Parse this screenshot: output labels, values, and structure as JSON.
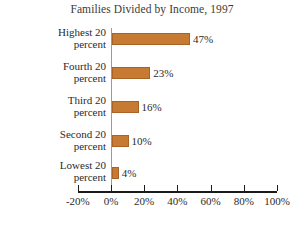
{
  "chart_data": {
    "type": "bar",
    "orientation": "horizontal",
    "title": "Families Divided by Income, 1997",
    "xlabel": "",
    "ylabel": "",
    "categories": [
      "Highest 20 percent",
      "Fourth 20 percent",
      "Third 20 percent",
      "Second 20 percent",
      "Lowest 20 percent"
    ],
    "category_lines": [
      [
        "Highest 20",
        "percent"
      ],
      [
        "Fourth 20",
        "percent"
      ],
      [
        "Third 20",
        "percent"
      ],
      [
        "Second 20",
        "percent"
      ],
      [
        "Lowest 20",
        "percent"
      ]
    ],
    "values": [
      47,
      23,
      16,
      10,
      4
    ],
    "value_labels": [
      "47%",
      "23%",
      "16%",
      "10%",
      "4%"
    ],
    "xlim": [
      -20,
      100
    ],
    "xticks": [
      -20,
      0,
      20,
      40,
      60,
      80,
      100
    ],
    "xtick_labels": [
      "-20%",
      "0%",
      "20%",
      "40%",
      "60%",
      "80%",
      "100%"
    ],
    "grid": false,
    "legend": null,
    "bar_color": "#c67a32",
    "bar_edge_color": "#a86325",
    "axis_color": "#1a1a1a",
    "zero_line_color": "#9b9b9b",
    "background": "#ffffff",
    "text_color": "#2b2b2b"
  }
}
